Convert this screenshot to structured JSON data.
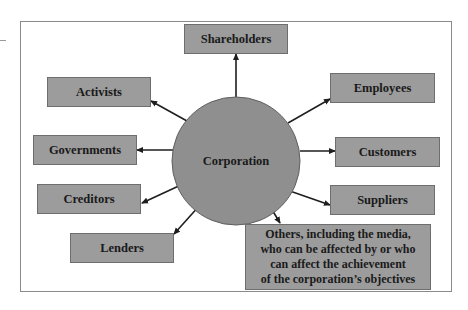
{
  "diagram": {
    "center": {
      "label": "Corporation",
      "color": "#8f8f8f"
    },
    "box_color": "#9c9c9c",
    "arrow_color": "#1e1e1e",
    "stakeholders": [
      {
        "id": "shareholders",
        "label": "Shareholders"
      },
      {
        "id": "activists",
        "label": "Activists"
      },
      {
        "id": "employees",
        "label": "Employees"
      },
      {
        "id": "governments",
        "label": "Governments"
      },
      {
        "id": "customers",
        "label": "Customers"
      },
      {
        "id": "creditors",
        "label": "Creditors"
      },
      {
        "id": "suppliers",
        "label": "Suppliers"
      },
      {
        "id": "lenders",
        "label": "Lenders"
      },
      {
        "id": "others",
        "label": "Others, including the media, who can be affected by or who can affect the achievement of the corporation’s objectives",
        "lines": [
          "Others, including the media,",
          "who can be affected by or who",
          "can affect the achievement",
          "of the corporation’s objectives"
        ]
      }
    ]
  }
}
